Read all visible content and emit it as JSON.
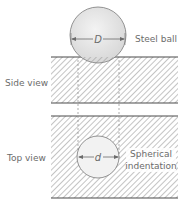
{
  "diagram": {
    "labels": {
      "steel_ball": "Steel ball",
      "side_view": "Side view",
      "top_view": "Top view",
      "spherical_line1": "Spherical",
      "spherical_line2": "indentation",
      "ball_diameter": "D",
      "indent_diameter": "d"
    },
    "colors": {
      "line": "#4a4a4a",
      "hatch": "#8a8a8a",
      "ball_fill": "#e6e6e6",
      "text": "#6b6b6b"
    }
  }
}
